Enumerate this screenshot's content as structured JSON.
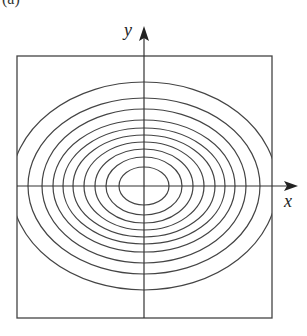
{
  "figure": {
    "panel_label": "(a)",
    "x_label": "x",
    "y_label": "y",
    "colors": {
      "stroke": "#444444",
      "background": "#ffffff"
    },
    "frame": {
      "left": 17,
      "top": 56,
      "right": 272,
      "bottom": 318
    },
    "origin": {
      "x": 144,
      "y": 186
    },
    "ellipses": [
      {
        "rx": 25,
        "ry": 19
      },
      {
        "rx": 38,
        "ry": 29
      },
      {
        "rx": 49,
        "ry": 37
      },
      {
        "rx": 60,
        "ry": 44
      },
      {
        "rx": 71,
        "ry": 51
      },
      {
        "rx": 81,
        "ry": 58
      },
      {
        "rx": 91,
        "ry": 66
      },
      {
        "rx": 102,
        "ry": 77
      },
      {
        "rx": 116,
        "ry": 88
      },
      {
        "rx": 133,
        "ry": 104
      }
    ]
  }
}
